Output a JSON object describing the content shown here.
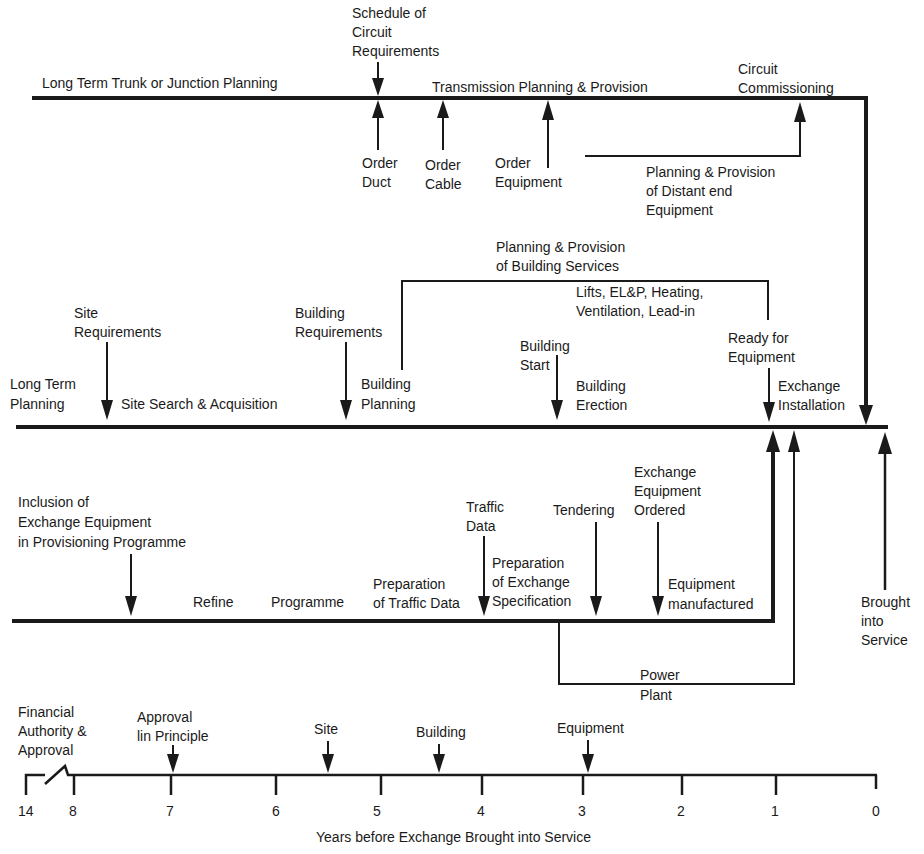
{
  "diagram": {
    "colors": {
      "ink": "#1a1a1a",
      "background": "#ffffff"
    },
    "trunk_line": {
      "label": "Long Term Trunk or Junction Planning",
      "transmission_label": "Transmission Planning & Provision",
      "schedule": [
        "Schedule of",
        "Circuit",
        "Requirements"
      ],
      "order_duct": [
        "Order",
        "Duct"
      ],
      "order_cable": [
        "Order",
        "Cable"
      ],
      "order_equipment": [
        "Order",
        "Equipment"
      ],
      "circuit_commissioning": [
        "Circuit",
        "Commissioning"
      ],
      "distant_end": [
        "Planning & Provision",
        "of Distant end",
        "Equipment"
      ]
    },
    "building_line": {
      "building_services": [
        "Planning & Provision",
        "of Building Services"
      ],
      "services_detail": [
        "Lifts, EL&P, Heating,",
        "Ventilation, Lead-in"
      ],
      "site_requirements": [
        "Site",
        "Requirements"
      ],
      "building_requirements": [
        "Building",
        "Requirements"
      ],
      "long_term_planning": [
        "Long Term",
        "Planning"
      ],
      "site_search": "Site Search & Acquisition",
      "building_planning": [
        "Building",
        "Planning"
      ],
      "building_start": [
        "Building",
        "Start"
      ],
      "building_erection": [
        "Building",
        "Erection"
      ],
      "ready_for_equipment": [
        "Ready for",
        "Equipment"
      ],
      "exchange_installation": [
        "Exchange",
        "Installation"
      ]
    },
    "equipment_line": {
      "inclusion": [
        "Inclusion of",
        "Exchange Equipment",
        "in Provisioning Programme"
      ],
      "refine": "Refine",
      "programme": "Programme",
      "prep_traffic": [
        "Preparation",
        "of Traffic Data"
      ],
      "traffic_data": [
        "Traffic",
        "Data"
      ],
      "prep_spec": [
        "Preparation",
        "of Exchange",
        "Specification"
      ],
      "tendering": "Tendering",
      "equipment_ordered": [
        "Exchange",
        "Equipment",
        "Ordered"
      ],
      "manufactured": [
        "Equipment",
        "manufactured"
      ],
      "power_plant": [
        "Power",
        "Plant"
      ],
      "brought_into_service": [
        "Brought",
        "into",
        "Service"
      ]
    },
    "timeline": {
      "financial": [
        "Financial",
        "Authority &",
        "Approval"
      ],
      "approval_principle": [
        "Approval",
        "lin Principle"
      ],
      "site": "Site",
      "building": "Building",
      "equipment": "Equipment",
      "ticks": [
        "14",
        "8",
        "7",
        "6",
        "5",
        "4",
        "3",
        "2",
        "1",
        "0"
      ],
      "axis_label": "Years before Exchange Brought into Service"
    }
  }
}
